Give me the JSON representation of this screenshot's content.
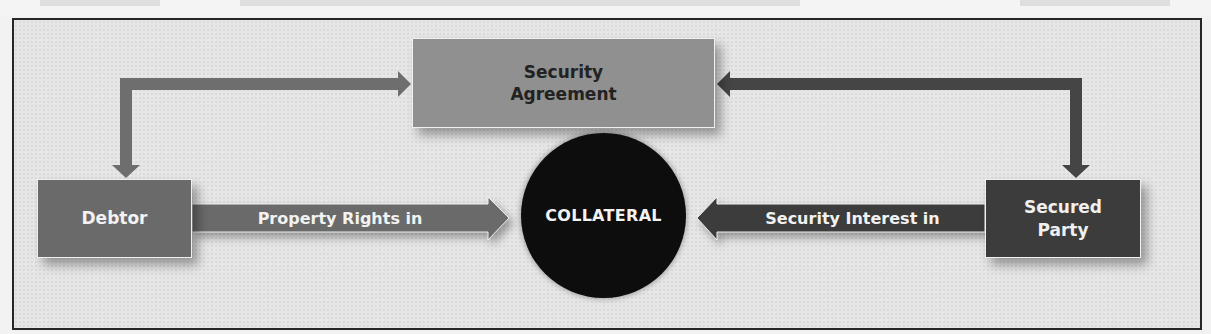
{
  "diagram": {
    "nodes": {
      "security_agreement": {
        "label_line1": "Security",
        "label_line2": "Agreement",
        "color": "#909090"
      },
      "debtor": {
        "label": "Debtor",
        "color": "#6a6a6a"
      },
      "secured_party": {
        "label_line1": "Secured",
        "label_line2": "Party",
        "color": "#3c3c3c"
      },
      "collateral": {
        "label": "COLLATERAL",
        "color": "#0d0d0d"
      }
    },
    "edges": {
      "debtor_to_collateral": {
        "label": "Property Rights in",
        "color": "#6a6a6a"
      },
      "secured_party_to_collateral": {
        "label": "Security Interest in",
        "color": "#3c3c3c"
      },
      "agreement_debtor_connector": {
        "color": "#6e6e6e"
      },
      "agreement_secured_connector": {
        "color": "#454545"
      }
    },
    "frame": {
      "background": "#e6e6e6",
      "border": "#262626"
    }
  }
}
